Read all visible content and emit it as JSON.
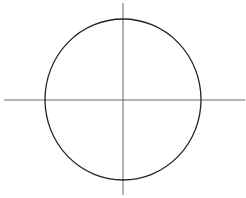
{
  "diagram": {
    "type": "circle-with-crosshair",
    "stroke_color": "#222222",
    "background": "#ffffff",
    "circle": {
      "cx": 123,
      "cy": 99.5,
      "rx": 78,
      "ry": 80.5
    },
    "horizontal_axis": {
      "x1": 4,
      "x2": 245,
      "y": 100
    },
    "vertical_axis": {
      "x": 123,
      "y1": 3,
      "y2": 195
    }
  }
}
